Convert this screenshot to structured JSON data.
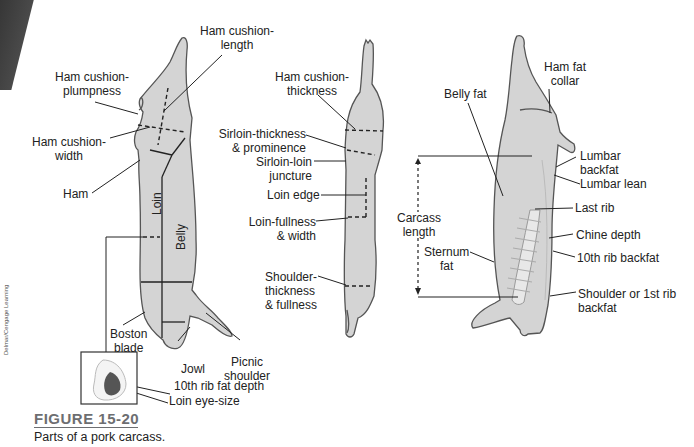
{
  "figure": {
    "number": "FIGURE 15-20",
    "caption": "Parts of a pork carcass.",
    "credit": "Delmar/Cengage Learning",
    "title_color": "#6d6e71"
  },
  "colors": {
    "carcass_fill": "#d4d4d4",
    "outline": "#555555",
    "lean_fill": "#555555",
    "line": "#222222"
  },
  "side_view_left": {
    "inner_labels": {
      "loin": "Loin",
      "belly": "Belly"
    },
    "labels": {
      "ham_cushion_length": [
        "Ham cushion-",
        "length"
      ],
      "ham_cushion_plumpness": [
        "Ham cushion-",
        "plumpness"
      ],
      "ham_cushion_width": [
        "Ham cushion-",
        "width"
      ],
      "ham": "Ham",
      "boston_blade": [
        "Boston",
        "blade"
      ],
      "jowl": "Jowl",
      "picnic_shoulder": [
        "Picnic",
        "shoulder"
      ],
      "tenth_rib_fat_depth": "10th rib fat depth",
      "loin_eye_size": "Loin eye-size"
    }
  },
  "top_view_middle": {
    "labels": {
      "ham_cushion_thickness": [
        "Ham cushion-",
        "thickness"
      ],
      "sirloin_thickness": [
        "Sirloin-thickness",
        "& prominence"
      ],
      "sirloin_loin_juncture": [
        "Sirloin-loin",
        "juncture"
      ],
      "loin_edge": "Loin edge",
      "loin_fullness": [
        "Loin-fullness",
        "& width"
      ],
      "shoulder_thickness": [
        "Shoulder-",
        "thickness",
        "& fullness"
      ]
    }
  },
  "split_view_right": {
    "labels": {
      "ham_fat_collar": [
        "Ham fat",
        "collar"
      ],
      "belly_fat": "Belly fat",
      "lumbar_backfat": [
        "Lumbar",
        "backfat"
      ],
      "lumbar_lean": "Lumbar lean",
      "last_rib": "Last rib",
      "carcass_length": [
        "Carcass",
        "length"
      ],
      "chine_depth": "Chine depth",
      "sternum_fat": [
        "Sternum",
        "fat"
      ],
      "tenth_rib_backfat": "10th rib backfat",
      "shoulder_backfat": [
        "Shoulder or 1st rib",
        "backfat"
      ]
    }
  }
}
